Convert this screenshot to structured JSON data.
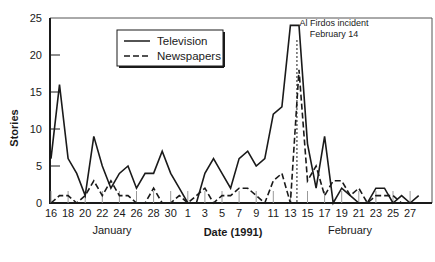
{
  "chart_data": {
    "type": "line",
    "title": "",
    "xlabel": "Date (1991)",
    "ylabel": "Stories",
    "ylim": [
      0,
      25
    ],
    "yticks": [
      0,
      5,
      10,
      15,
      20,
      25
    ],
    "grid": false,
    "legend_position": "upper-left-inside",
    "x_tick_labels": [
      "16",
      "18",
      "20",
      "22",
      "24",
      "26",
      "28",
      "30",
      "1",
      "3",
      "5",
      "7",
      "9",
      "11",
      "13",
      "15",
      "17",
      "19",
      "21",
      "23",
      "25",
      "27"
    ],
    "month_labels": [
      "January",
      "February"
    ],
    "x": [
      "Jan 16",
      "Jan 17",
      "Jan 18",
      "Jan 19",
      "Jan 20",
      "Jan 21",
      "Jan 22",
      "Jan 23",
      "Jan 24",
      "Jan 25",
      "Jan 26",
      "Jan 27",
      "Jan 28",
      "Jan 29",
      "Jan 30",
      "Jan 31",
      "Feb 1",
      "Feb 2",
      "Feb 3",
      "Feb 4",
      "Feb 5",
      "Feb 6",
      "Feb 7",
      "Feb 8",
      "Feb 9",
      "Feb 10",
      "Feb 11",
      "Feb 12",
      "Feb 13",
      "Feb 14",
      "Feb 15",
      "Feb 16",
      "Feb 17",
      "Feb 18",
      "Feb 19",
      "Feb 20",
      "Feb 21",
      "Feb 22",
      "Feb 23",
      "Feb 24",
      "Feb 25",
      "Feb 26",
      "Feb 27",
      "Feb 28"
    ],
    "series": [
      {
        "name": "Television",
        "style": "solid",
        "values": [
          6,
          16,
          6,
          4,
          1,
          9,
          5,
          2,
          4,
          5,
          2,
          4,
          4,
          7,
          4,
          2,
          0,
          0,
          4,
          6,
          4,
          2,
          6,
          7,
          5,
          6,
          12,
          13,
          24,
          24,
          8,
          2,
          9,
          0,
          2,
          1,
          0,
          0,
          2,
          2,
          0,
          1,
          0,
          1
        ]
      },
      {
        "name": "Newspapers",
        "style": "dashed",
        "values": [
          0,
          1,
          1,
          0,
          1,
          3,
          1,
          3,
          1,
          1,
          0,
          0,
          2,
          0,
          0,
          1,
          0,
          1,
          2,
          0,
          1,
          1,
          2,
          2,
          1,
          0,
          3,
          4,
          0,
          18,
          3,
          5,
          1,
          3,
          3,
          1,
          2,
          0,
          1,
          1,
          1,
          0,
          0,
          0
        ]
      }
    ],
    "annotations": [
      {
        "text": "Al Firdos incident",
        "text2": "February 14",
        "x": "Feb 14",
        "style": "dotted vertical line"
      }
    ]
  },
  "labels": {
    "ylabel": "Stories",
    "xlabel": "Date (1991)",
    "month_jan": "January",
    "month_feb": "February",
    "legend_tv": "Television",
    "legend_np": "Newspapers",
    "annot_line1": "Al Firdos incident",
    "annot_line2": "February 14"
  },
  "colors": {
    "line": "#1a1a1a",
    "background": "#ffffff"
  }
}
